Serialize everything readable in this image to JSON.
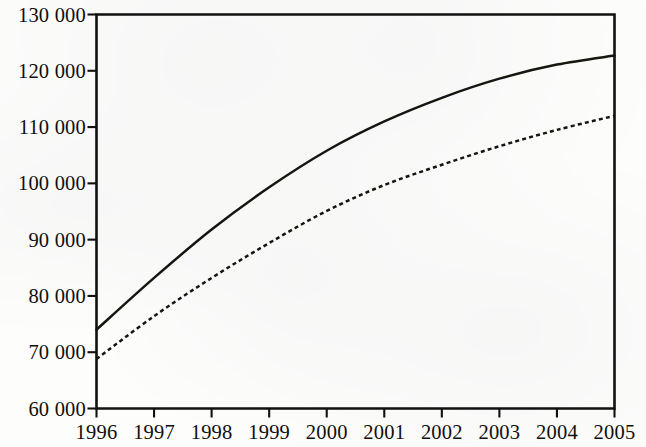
{
  "chart_data": {
    "type": "line",
    "title": "",
    "subtitle": "",
    "xlabel": "",
    "ylabel": "",
    "grid": false,
    "legend": "none",
    "x": [
      1996,
      1997,
      1998,
      1999,
      2000,
      2001,
      2002,
      2003,
      2004,
      2005
    ],
    "xtick_labels": [
      "1996",
      "1997",
      "1998",
      "1999",
      "2000",
      "2001",
      "2002",
      "2003",
      "2004",
      "2005"
    ],
    "ytick_labels": [
      "60 000",
      "70 000",
      "80 000",
      "90 000",
      "100 000",
      "110 000",
      "120 000",
      "130 000"
    ],
    "ytick_values": [
      60000,
      70000,
      80000,
      90000,
      100000,
      110000,
      120000,
      130000
    ],
    "xlim": [
      1996,
      2005
    ],
    "ylim": [
      60000,
      130000
    ],
    "series": [
      {
        "name": "solid-series",
        "style": "solid",
        "color": "#16150f",
        "values": [
          74000,
          83200,
          91800,
          99300,
          105800,
          111000,
          115200,
          118600,
          121100,
          122700
        ]
      },
      {
        "name": "dashed-series",
        "style": "dashed",
        "color": "#16150f",
        "values": [
          68800,
          76400,
          83200,
          89400,
          95100,
          99700,
          103300,
          106600,
          109500,
          112000
        ]
      }
    ]
  },
  "axes": {
    "y_labels": [
      {
        "text": "130 000",
        "value": 130000
      },
      {
        "text": "120 000",
        "value": 120000
      },
      {
        "text": "110 000",
        "value": 110000
      },
      {
        "text": "100 000",
        "value": 100000
      },
      {
        "text": "90 000",
        "value": 90000
      },
      {
        "text": "80 000",
        "value": 80000
      },
      {
        "text": "70 000",
        "value": 70000
      },
      {
        "text": "60 000",
        "value": 60000
      }
    ],
    "x_labels": [
      {
        "text": "1996",
        "value": 1996
      },
      {
        "text": "1997",
        "value": 1997
      },
      {
        "text": "1998",
        "value": 1998
      },
      {
        "text": "1999",
        "value": 1999
      },
      {
        "text": "2000",
        "value": 2000
      },
      {
        "text": "2001",
        "value": 2001
      },
      {
        "text": "2002",
        "value": 2002
      },
      {
        "text": "2003",
        "value": 2003
      },
      {
        "text": "2004",
        "value": 2004
      },
      {
        "text": "2005",
        "value": 2005
      }
    ]
  },
  "colors": {
    "ink": "#16150f",
    "axis": "#12110f",
    "background": "#fdfdfc"
  }
}
